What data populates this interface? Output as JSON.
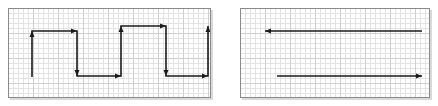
{
  "figure": {
    "background_color": "#ffffff",
    "panel_border_color": "#8a8a8a",
    "grid_minor_color": "#e3e3e3",
    "grid_major_color": "#cfcfcf",
    "grid_cell_px": 5,
    "grid_major_every": 5,
    "stroke_color": "#1a1a1a",
    "stroke_width": 1.6,
    "arrow_head_length": 6,
    "arrow_head_width": 5,
    "shadow_color": "#d9d9d9"
  },
  "panels": [
    {
      "name": "left-panel",
      "label": "left panel",
      "x": 8,
      "y": 8,
      "width": 203,
      "height": 90,
      "paths": [
        {
          "name": "zigzag-path",
          "label": "square-wave zigzag polyline with seven arrowheads",
          "points": [
            [
              32,
              77
            ],
            [
              32,
              31
            ],
            [
              77,
              31
            ],
            [
              77,
              76
            ],
            [
              121,
              76
            ],
            [
              121,
              26
            ],
            [
              166,
              26
            ],
            [
              166,
              76
            ],
            [
              208,
              76
            ],
            [
              208,
              26
            ]
          ],
          "arrow_vertices": [
            1,
            2,
            3,
            4,
            5,
            6,
            7,
            8,
            9
          ],
          "arrow_directions": [
            "up",
            "right",
            "down",
            "right",
            "up",
            "right",
            "down",
            "right",
            "up"
          ]
        }
      ]
    },
    {
      "name": "right-panel",
      "label": "right panel",
      "x": 240,
      "y": 8,
      "width": 190,
      "height": 90,
      "paths": [
        {
          "name": "top-left-arrow",
          "label": "long horizontal arrow pointing left",
          "points": [
            [
              422,
              31
            ],
            [
              265,
              31
            ]
          ],
          "arrow_vertices": [
            1
          ],
          "arrow_directions": [
            "left"
          ]
        },
        {
          "name": "bottom-right-arrow",
          "label": "long horizontal arrow pointing right",
          "points": [
            [
              277,
              76
            ],
            [
              422,
              76
            ]
          ],
          "arrow_vertices": [
            1
          ],
          "arrow_directions": [
            "right"
          ]
        }
      ]
    }
  ]
}
